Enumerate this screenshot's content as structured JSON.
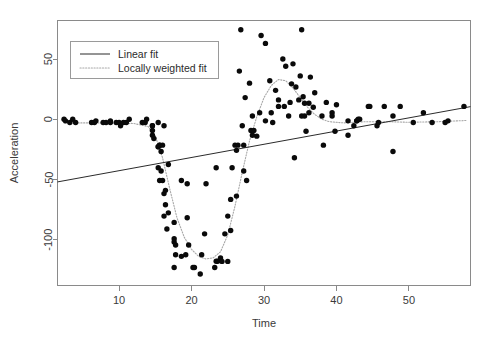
{
  "chart_data": {
    "type": "scatter",
    "title": "",
    "xlabel": "Time",
    "ylabel": "Acceleration",
    "xlim": [
      1.5,
      58.5
    ],
    "ylim": [
      -138,
      82
    ],
    "xticks": [
      10,
      20,
      30,
      40,
      50
    ],
    "yticks": [
      50,
      0,
      -50,
      -100
    ],
    "xticklabels": [
      "10",
      "20",
      "30",
      "40",
      "50"
    ],
    "yticklabels": [
      "50",
      "0",
      "-50",
      "-100"
    ],
    "grid": false,
    "legend_position": "top-left",
    "legend": [
      {
        "label": "Linear fit",
        "style": "solid",
        "color": "#2b2b2b"
      },
      {
        "label": "Locally weighted fit",
        "style": "dotted",
        "color": "#a8a8a8"
      }
    ],
    "series": [
      {
        "name": "observations",
        "type": "scatter",
        "marker": "filled-circle",
        "color": "#0a0a0a",
        "points": [
          [
            2.4,
            0.0
          ],
          [
            2.6,
            -1.3
          ],
          [
            3.2,
            -2.7
          ],
          [
            3.6,
            0.0
          ],
          [
            4.0,
            -2.7
          ],
          [
            6.2,
            -2.7
          ],
          [
            6.6,
            -2.7
          ],
          [
            6.8,
            -1.3
          ],
          [
            7.8,
            -2.7
          ],
          [
            8.2,
            -2.7
          ],
          [
            8.8,
            -1.3
          ],
          [
            8.8,
            -2.7
          ],
          [
            9.6,
            -2.7
          ],
          [
            10.0,
            -2.7
          ],
          [
            10.2,
            -5.4
          ],
          [
            10.6,
            -2.7
          ],
          [
            11.0,
            -2.7
          ],
          [
            11.4,
            0.0
          ],
          [
            13.2,
            -2.7
          ],
          [
            13.6,
            -2.7
          ],
          [
            13.8,
            0.0
          ],
          [
            14.6,
            -13.3
          ],
          [
            14.6,
            -5.4
          ],
          [
            14.6,
            -5.4
          ],
          [
            14.6,
            -9.3
          ],
          [
            14.8,
            -16.0
          ],
          [
            15.4,
            -22.8
          ],
          [
            15.4,
            -2.7
          ],
          [
            15.4,
            -22.8
          ],
          [
            15.4,
            -40.2
          ],
          [
            15.6,
            -21.5
          ],
          [
            15.6,
            -21.5
          ],
          [
            15.6,
            -50.8
          ],
          [
            15.8,
            -42.9
          ],
          [
            15.8,
            -26.8
          ],
          [
            16.0,
            -21.5
          ],
          [
            16.0,
            -50.8
          ],
          [
            16.2,
            -61.7
          ],
          [
            16.2,
            -5.4
          ],
          [
            16.2,
            -80.4
          ],
          [
            16.4,
            -59.0
          ],
          [
            16.4,
            -71.0
          ],
          [
            16.6,
            -91.1
          ],
          [
            16.8,
            -77.7
          ],
          [
            16.8,
            -37.5
          ],
          [
            17.6,
            -85.6
          ],
          [
            17.6,
            -123.1
          ],
          [
            17.6,
            -101.9
          ],
          [
            17.6,
            -99.1
          ],
          [
            17.8,
            -104.4
          ],
          [
            17.8,
            -112.5
          ],
          [
            18.6,
            -50.8
          ],
          [
            18.6,
            -113.8
          ],
          [
            19.2,
            -112.5
          ],
          [
            19.4,
            -81.8
          ],
          [
            19.4,
            -53.5
          ],
          [
            19.6,
            -104.4
          ],
          [
            20.2,
            -123.1
          ],
          [
            20.4,
            -123.1
          ],
          [
            21.2,
            -128.5
          ],
          [
            21.4,
            -112.5
          ],
          [
            21.8,
            -95.1
          ],
          [
            22.0,
            -53.5
          ],
          [
            23.2,
            -123.1
          ],
          [
            23.4,
            -40.2
          ],
          [
            23.4,
            -117.9
          ],
          [
            23.6,
            -117.9
          ],
          [
            24.0,
            -115.2
          ],
          [
            24.2,
            -118.0
          ],
          [
            24.6,
            -95.1
          ],
          [
            25.0,
            -118.0
          ],
          [
            25.0,
            -80.4
          ],
          [
            25.4,
            -66.5
          ],
          [
            25.4,
            -92.4
          ],
          [
            25.6,
            -40.2
          ],
          [
            26.0,
            -21.5
          ],
          [
            26.2,
            -63.8
          ],
          [
            26.2,
            -25.8
          ],
          [
            26.4,
            -21.5
          ],
          [
            27.0,
            -5.4
          ],
          [
            27.2,
            -42.9
          ],
          [
            27.2,
            -21.5
          ],
          [
            27.6,
            -50.8
          ],
          [
            28.2,
            -9.3
          ],
          [
            28.4,
            2.7
          ],
          [
            28.4,
            -13.3
          ],
          [
            28.6,
            -9.3
          ],
          [
            29.4,
            5.4
          ],
          [
            30.2,
            -1.3
          ],
          [
            31.0,
            5.4
          ],
          [
            31.2,
            -2.7
          ],
          [
            32.0,
            10.7
          ],
          [
            32.0,
            16.1
          ],
          [
            32.8,
            10.7
          ],
          [
            33.4,
            2.7
          ],
          [
            33.8,
            29.4
          ],
          [
            34.4,
            26.8
          ],
          [
            34.8,
            16.1
          ],
          [
            35.2,
            74.3
          ],
          [
            35.2,
            2.7
          ],
          [
            35.4,
            18.7
          ],
          [
            35.6,
            2.7
          ],
          [
            35.6,
            13.3
          ],
          [
            36.2,
            13.3
          ],
          [
            36.2,
            5.4
          ],
          [
            38.0,
            2.7
          ],
          [
            38.2,
            -21.5
          ],
          [
            39.4,
            5.4
          ],
          [
            39.4,
            2.7
          ],
          [
            41.6,
            -13.3
          ],
          [
            41.6,
            -1.3
          ],
          [
            42.4,
            -5.4
          ],
          [
            42.8,
            -1.3
          ],
          [
            42.8,
            -1.3
          ],
          [
            43.0,
            0.0
          ],
          [
            43.2,
            0.0
          ],
          [
            44.4,
            10.7
          ],
          [
            44.6,
            10.7
          ],
          [
            45.6,
            -5.4
          ],
          [
            45.8,
            -2.7
          ],
          [
            46.6,
            10.7
          ],
          [
            47.8,
            -26.8
          ],
          [
            47.8,
            2.7
          ],
          [
            48.8,
            10.7
          ],
          [
            50.6,
            -2.7
          ],
          [
            52.0,
            5.4
          ],
          [
            53.2,
            -2.7
          ],
          [
            55.0,
            -2.7
          ],
          [
            55.4,
            -1.3
          ],
          [
            57.6,
            10.7
          ],
          [
            26.8,
            74.3
          ],
          [
            29.6,
            69.6
          ],
          [
            30.2,
            63.0
          ],
          [
            32.6,
            50.0
          ],
          [
            33.0,
            44.0
          ],
          [
            34.0,
            46.0
          ],
          [
            35.0,
            36.0
          ],
          [
            36.4,
            35.0
          ],
          [
            37.0,
            22.0
          ],
          [
            30.8,
            32.0
          ],
          [
            31.6,
            24.0
          ],
          [
            33.6,
            14.0
          ],
          [
            28.0,
            30.0
          ],
          [
            27.4,
            18.0
          ],
          [
            38.6,
            14.0
          ],
          [
            40.0,
            12.0
          ],
          [
            36.8,
            10.0
          ],
          [
            35.8,
            -10.0
          ],
          [
            39.8,
            -10.0
          ],
          [
            34.2,
            -32.0
          ],
          [
            29.0,
            -14.0
          ],
          [
            26.6,
            40.0
          ]
        ]
      },
      {
        "name": "Linear fit",
        "type": "line",
        "style": "solid",
        "color": "#2b2b2b",
        "endpoints": [
          [
            1.5,
            -52.0
          ],
          [
            58.5,
            10.5
          ]
        ],
        "slope": 1.1,
        "intercept": -53.6
      },
      {
        "name": "Locally weighted fit",
        "type": "line",
        "style": "dotted",
        "color": "#a8a8a8",
        "points": [
          [
            2.4,
            -3.0
          ],
          [
            6.0,
            -3.0
          ],
          [
            9.0,
            -3.0
          ],
          [
            12.0,
            -3.5
          ],
          [
            14.0,
            -6.0
          ],
          [
            15.0,
            -14.0
          ],
          [
            16.0,
            -32.0
          ],
          [
            17.0,
            -58.0
          ],
          [
            18.0,
            -82.0
          ],
          [
            19.0,
            -98.0
          ],
          [
            20.0,
            -108.0
          ],
          [
            21.0,
            -114.0
          ],
          [
            22.0,
            -116.0
          ],
          [
            23.0,
            -115.0
          ],
          [
            24.0,
            -110.0
          ],
          [
            25.0,
            -96.0
          ],
          [
            26.0,
            -72.0
          ],
          [
            27.0,
            -44.0
          ],
          [
            28.0,
            -18.0
          ],
          [
            29.0,
            2.0
          ],
          [
            30.0,
            18.0
          ],
          [
            31.0,
            28.0
          ],
          [
            32.0,
            33.0
          ],
          [
            33.0,
            32.0
          ],
          [
            34.0,
            26.0
          ],
          [
            35.0,
            18.0
          ],
          [
            36.0,
            10.0
          ],
          [
            37.0,
            4.0
          ],
          [
            38.0,
            0.0
          ],
          [
            39.0,
            -2.0
          ],
          [
            41.0,
            -3.0
          ],
          [
            44.0,
            -2.0
          ],
          [
            47.0,
            -2.0
          ],
          [
            50.0,
            -2.5
          ],
          [
            54.0,
            -2.0
          ],
          [
            58.0,
            -1.0
          ]
        ]
      }
    ]
  }
}
